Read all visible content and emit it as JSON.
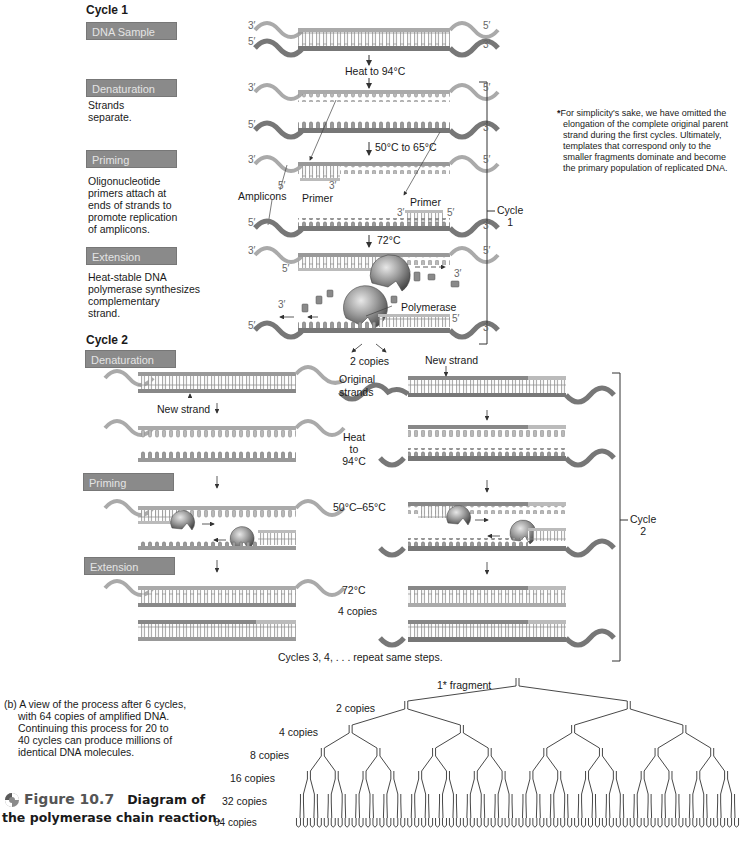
{
  "figure": {
    "number_label": "Figure 10.7",
    "title_line1": "Diagram of",
    "title_line2": "the polymerase chain reaction.",
    "icon": "swirl-icon"
  },
  "cycle1": {
    "heading": "Cycle 1",
    "bracket_label_line1": "Cycle",
    "bracket_label_line2": "1",
    "steps": [
      {
        "tag": "DNA Sample",
        "desc": ""
      },
      {
        "tag": "Denaturation",
        "desc_lines": [
          "Strands",
          "separate."
        ]
      },
      {
        "tag": "Priming",
        "desc_lines": [
          "Oligonucleotide",
          "primers attach at",
          "ends of strands to",
          "promote replication",
          "of amplicons."
        ]
      },
      {
        "tag": "Extension",
        "desc_lines": [
          "Heat-stable DNA",
          "polymerase synthesizes",
          "complementary",
          "strand."
        ]
      }
    ],
    "labels": {
      "heat": "Heat to 94°C",
      "anneal": "50°C to 65°C",
      "extend": "72°C",
      "amplicons": "Amplicons",
      "primer_left": "Primer",
      "primer_right": "Primer",
      "polymerase": "Polymerase",
      "two_copies": "2 copies"
    },
    "ends": {
      "three": "3′",
      "five": "5′"
    }
  },
  "footnote": {
    "star": "*",
    "lines": [
      "For simplicity's sake, we have omitted the",
      "elongation of the complete original parent",
      "strand during the first cycles. Ultimately,",
      "templates that correspond only to the",
      "smaller fragments dominate and become",
      "the primary population of replicated DNA."
    ]
  },
  "cycle2": {
    "heading": "Cycle 2",
    "bracket_label_line1": "Cycle",
    "bracket_label_line2": "2",
    "steps": [
      {
        "tag": "Denaturation"
      },
      {
        "tag": "Priming"
      },
      {
        "tag": "Extension"
      }
    ],
    "labels": {
      "new_strand_left": "New strand",
      "new_strand_top": "New strand",
      "original_line1": "Original",
      "original_line2": "strands",
      "heat_line1": "Heat",
      "heat_line2": "to",
      "heat_line3": "94°C",
      "anneal": "50°C–65°C",
      "extend": "72°C",
      "four_copies": "4 copies",
      "repeat": "Cycles 3, 4, . . . repeat same steps."
    }
  },
  "part_b": {
    "lines": [
      "(b) A view of the process after 6 cycles,",
      "with 64 copies of amplified DNA.",
      "Continuing this process for 20 to",
      "40 cycles can produce millions of",
      "identical DNA molecules."
    ]
  },
  "chart_data": {
    "type": "tree",
    "levels": [
      {
        "label": "1* fragment",
        "copies": 1
      },
      {
        "label": "2 copies",
        "copies": 2
      },
      {
        "label": "4 copies",
        "copies": 4
      },
      {
        "label": "8 copies",
        "copies": 8
      },
      {
        "label": "16 copies",
        "copies": 16
      },
      {
        "label": "32 copies",
        "copies": 32
      },
      {
        "label": "64 copies",
        "copies": 64
      }
    ]
  }
}
